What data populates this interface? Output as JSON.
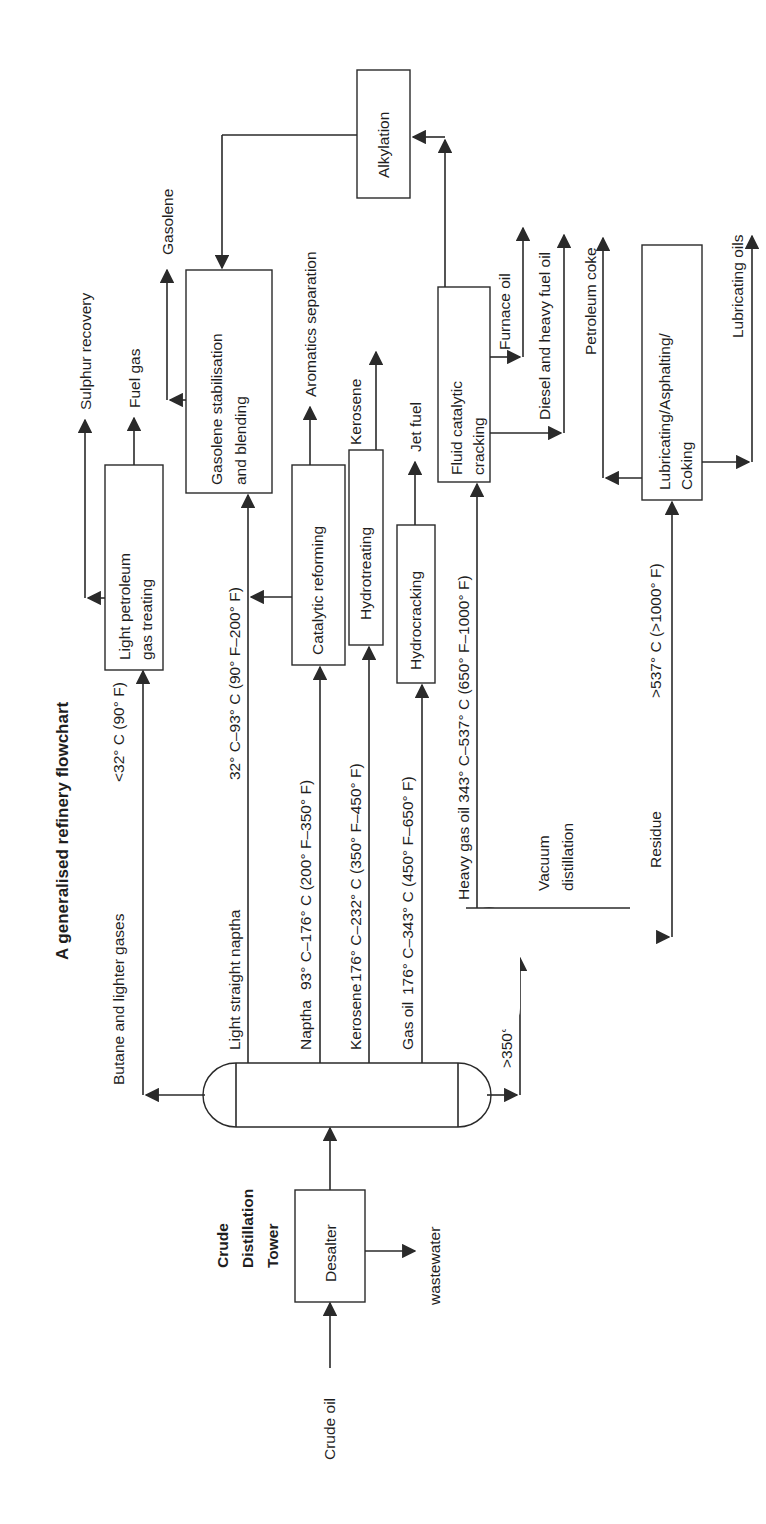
{
  "title": "A generalised refinery flowchart",
  "units": {
    "crude_tower_label": [
      "Crude",
      "Distillation",
      "Tower"
    ],
    "desalter": "Desalter",
    "vacuum_distillation": [
      "Vacuum",
      "distillation"
    ],
    "lpg_treating": [
      "Light petroleum",
      "gas treating"
    ],
    "gasolene_stabilisation": [
      "Gasolene stabilisation",
      "and blending"
    ],
    "catalytic_reforming": "Catalytic reforming",
    "hydrotreating": "Hydrotreating",
    "hydrocracking": "Hydrocracking",
    "fluid_catalytic_cracking": [
      "Fluid catalytic",
      "cracking"
    ],
    "alkylation": "Alkylation",
    "lubricating": [
      "Lubricating/Asphalting/",
      "Coking"
    ]
  },
  "streams": {
    "crude_oil": "Crude oil",
    "wastewater": "wastewater",
    "butane": "Butane and lighter gases",
    "butane_temp": "<32° C (90° F)",
    "light_naptha": "Light straight naptha",
    "light_naptha_temp": "32° C–93° C (90° F–200° F)",
    "naptha": "Naptha",
    "naptha_temp": "93° C–176° C (200° F–350° F)",
    "kerosene": "Kerosene",
    "kerosene_temp": "176° C–232° C (350° F–450° F)",
    "gas_oil": "Gas oil",
    "gas_oil_temp": "176° C–343° C (450° F–650° F)",
    "heavy_gas_oil": "Heavy gas oil 343° C–537° C (650° F–1000° F)",
    "bottoms": ">350° C",
    "residue": "Residue",
    "residue_temp": ">537° C (>1000° F)"
  },
  "products": {
    "sulphur_recovery": "Sulphur recovery",
    "fuel_gas": "Fuel gas",
    "gasolene": "Gasolene",
    "aromatics": "Aromatics separation",
    "kerosene": "Kerosene",
    "jet_fuel": "Jet fuel",
    "furnace_oil": "Furnace oil",
    "diesel": "Diesel and heavy fuel oil",
    "petroleum_coke": "Petroleum coke",
    "lubricating_oils": "Lubricating oils"
  }
}
